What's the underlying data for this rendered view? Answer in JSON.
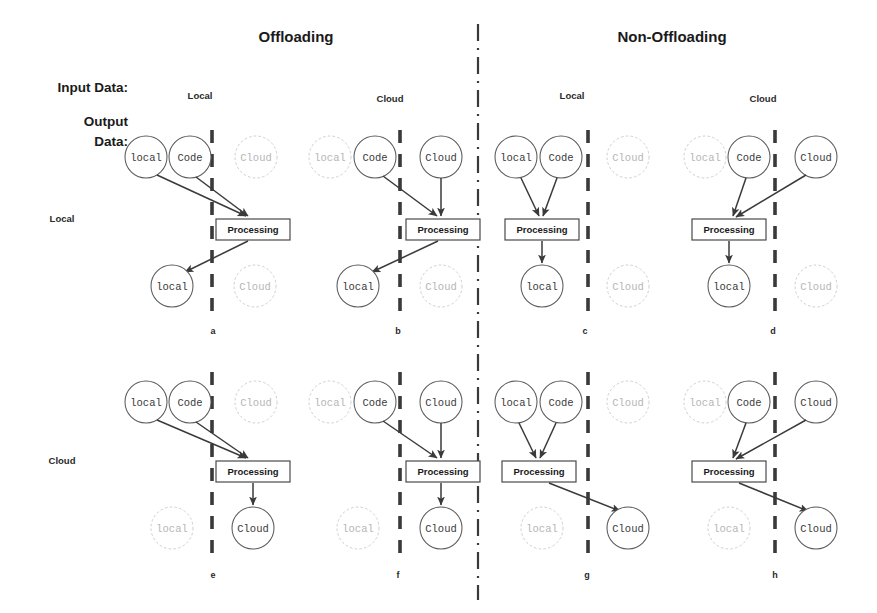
{
  "figure": {
    "width": 877,
    "height": 613,
    "background": "#ffffff",
    "ink_color": "#3a3a3a",
    "faded_color": "#cfcfcf"
  },
  "group_titles": {
    "offloading": "Offloading",
    "non_offloading": "Non-Offloading"
  },
  "axis_labels": {
    "input": "Input Data:",
    "output": "Output Data:"
  },
  "row_labels": {
    "local": "Local",
    "cloud": "Cloud"
  },
  "column_headers": [
    {
      "id": "col-a",
      "label": "Local"
    },
    {
      "id": "col-b",
      "label": "Cloud"
    },
    {
      "id": "col-c",
      "label": "Local"
    },
    {
      "id": "col-d",
      "label": "Cloud"
    }
  ],
  "node_labels": {
    "local": "local",
    "code": "Code",
    "cloud": "Cloud"
  },
  "process_label": "Processing",
  "panel_letters": {
    "a": "a",
    "b": "b",
    "c": "c",
    "d": "d",
    "e": "e",
    "f": "f",
    "g": "g",
    "h": "h"
  },
  "panels": [
    {
      "letter": "a",
      "group": "Offloading",
      "input_data": "Local",
      "output_data": "Local",
      "processing_side": "cloud",
      "inputs_active": [
        "local",
        "code"
      ],
      "outputs_active": [
        "local"
      ]
    },
    {
      "letter": "b",
      "group": "Offloading",
      "input_data": "Cloud",
      "output_data": "Local",
      "processing_side": "cloud",
      "inputs_active": [
        "code",
        "cloud"
      ],
      "outputs_active": [
        "local"
      ]
    },
    {
      "letter": "c",
      "group": "Non-Offloading",
      "input_data": "Local",
      "output_data": "Local",
      "processing_side": "local",
      "inputs_active": [
        "local",
        "code"
      ],
      "outputs_active": [
        "local"
      ]
    },
    {
      "letter": "d",
      "group": "Non-Offloading",
      "input_data": "Cloud",
      "output_data": "Local",
      "processing_side": "local",
      "inputs_active": [
        "code",
        "cloud"
      ],
      "outputs_active": [
        "local"
      ]
    },
    {
      "letter": "e",
      "group": "Offloading",
      "input_data": "Local",
      "output_data": "Cloud",
      "processing_side": "cloud",
      "inputs_active": [
        "local",
        "code"
      ],
      "outputs_active": [
        "cloud"
      ]
    },
    {
      "letter": "f",
      "group": "Offloading",
      "input_data": "Cloud",
      "output_data": "Cloud",
      "processing_side": "cloud",
      "inputs_active": [
        "code",
        "cloud"
      ],
      "outputs_active": [
        "cloud"
      ]
    },
    {
      "letter": "g",
      "group": "Non-Offloading",
      "input_data": "Local",
      "output_data": "Cloud",
      "processing_side": "local",
      "inputs_active": [
        "local",
        "code"
      ],
      "outputs_active": [
        "cloud"
      ]
    },
    {
      "letter": "h",
      "group": "Non-Offloading",
      "input_data": "Cloud",
      "output_data": "Cloud",
      "processing_side": "local",
      "inputs_active": [
        "code",
        "cloud"
      ],
      "outputs_active": [
        "cloud"
      ]
    }
  ]
}
